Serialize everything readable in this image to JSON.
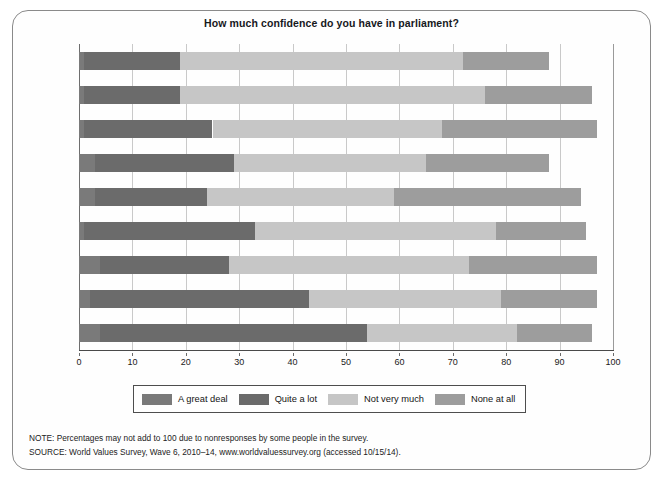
{
  "figure": {
    "title": "How much confidence do you have in parliament?",
    "notes": [
      "NOTE: Percentages may not add to 100 due to nonresponses by some people in the survey.",
      "SOURCE: World Values Survey, Wave 6, 2010–14, www.worldvaluessurvey.org (accessed 10/15/14)."
    ]
  },
  "colors": {
    "a_great_deal": "#7a7a7a",
    "quite_a_lot": "#6b6b6b",
    "not_very_much": "#c6c6c6",
    "none_at_all": "#9d9d9d",
    "gridline": "#c9c9c9",
    "axis": "#4a4a4a",
    "frame": "#8a8a8a",
    "text": "#1a1a1a"
  },
  "chart_data": {
    "type": "bar",
    "orientation": "horizontal",
    "stacked": true,
    "title": "How much confidence do you have in parliament?",
    "xlabel": "",
    "ylabel": "",
    "xlim": [
      0,
      100
    ],
    "xticks": [
      0,
      10,
      20,
      30,
      40,
      50,
      60,
      70,
      80,
      90,
      100
    ],
    "grid": true,
    "legend_position": "bottom",
    "categories": [
      "Japan",
      "United States",
      "Chile",
      "Russia",
      "Mexico",
      "Spain",
      "Australia",
      "Germany",
      "Turkey"
    ],
    "series": [
      {
        "name": "A great deal",
        "color": "#7a7a7a",
        "values": [
          1,
          1,
          1,
          3,
          3,
          1,
          4,
          2,
          4
        ]
      },
      {
        "name": "Quite a lot",
        "color": "#6b6b6b",
        "values": [
          18,
          18,
          24,
          26,
          21,
          32,
          24,
          41,
          50
        ]
      },
      {
        "name": "Not very much",
        "color": "#c6c6c6",
        "values": [
          53,
          57,
          43,
          36,
          35,
          45,
          45,
          36,
          28
        ]
      },
      {
        "name": "None at all",
        "color": "#9d9d9d",
        "values": [
          16,
          20,
          29,
          23,
          35,
          17,
          24,
          18,
          14
        ]
      }
    ],
    "totals": [
      88,
      96,
      97,
      88,
      94,
      95,
      97,
      97,
      96
    ]
  }
}
